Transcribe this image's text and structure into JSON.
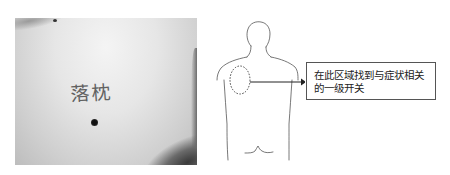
{
  "photo": {
    "handwritten_label": "落枕",
    "marker": "acupoint-dot"
  },
  "diagram": {
    "figure": "back-view-human-outline",
    "region_marker": "dashed-circle-left-shoulder-blade",
    "arrow": "right-arrow",
    "callout": {
      "line1": "在此区域找到与症状相关",
      "line2": "的一级开关"
    }
  }
}
